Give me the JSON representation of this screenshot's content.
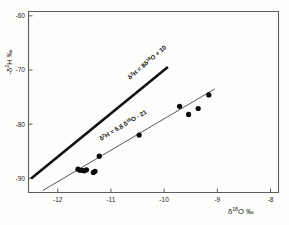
{
  "figure": {
    "kind": "isotope-cross-plot",
    "background_color": "#fdfdfc"
  },
  "axes": {
    "x_title_main": "O",
    "x_title_delta": "δ",
    "x_title_sup": "18",
    "x_title_permil": "‰",
    "y_title_delta": "-δ",
    "y_title_sup": "2",
    "y_title_main": "H",
    "y_title_permil": "‰",
    "x_ticks": [
      "-12",
      "-11",
      "-10",
      "-9",
      "-8"
    ],
    "y_ticks": [
      "-60",
      "-70",
      "-80",
      "-90"
    ],
    "x_tick_values": [
      -12,
      -11,
      -10,
      -9,
      -8
    ],
    "y_tick_values": [
      -60,
      -70,
      -80,
      -90
    ]
  },
  "annotations": {
    "gmwl": {
      "prefix": "δ",
      "sup1": "2",
      "mid": "H = 8δ",
      "sup2": "18",
      "suffix": "O + 10",
      "full_text": "δ²H = 8δ¹⁸O + 10",
      "rotation": -41,
      "x": 130,
      "y": 80
    },
    "lmwl": {
      "prefix": "δ",
      "sup1": "2",
      "mid": "H = 5.8 δ",
      "sup2": "18",
      "suffix": "O - 21",
      "full_text": "δ²H = 5.8 δ¹⁸O - 21",
      "rotation": -31,
      "x": 101,
      "y": 141
    }
  },
  "chart_data": {
    "type": "scatter",
    "title": "",
    "subtitle": "",
    "xlabel": "δ¹⁸O ‰",
    "ylabel": "-δ²H ‰",
    "xlim": [
      -12.55,
      -7.85
    ],
    "ylim": [
      -92.6,
      -59.2
    ],
    "grid": false,
    "legend": "none",
    "x": [
      -11.62,
      -11.58,
      -11.55,
      -11.5,
      -11.46,
      -11.33,
      -11.3,
      -11.22,
      -10.47,
      -9.71,
      -9.54,
      -9.36,
      -9.16
    ],
    "y": [
      -88.3,
      -88.5,
      -88.5,
      -88.6,
      -88.4,
      -88.9,
      -88.7,
      -85.9,
      -82.0,
      -76.7,
      -78.2,
      -77.1,
      -74.6
    ],
    "points": [
      {
        "x": -11.62,
        "y": -88.3
      },
      {
        "x": -11.58,
        "y": -88.5
      },
      {
        "x": -11.55,
        "y": -88.5
      },
      {
        "x": -11.5,
        "y": -88.6
      },
      {
        "x": -11.46,
        "y": -88.4
      },
      {
        "x": -11.33,
        "y": -88.9
      },
      {
        "x": -11.3,
        "y": -88.7
      },
      {
        "x": -11.22,
        "y": -85.9
      },
      {
        "x": -10.47,
        "y": -82.0
      },
      {
        "x": -9.71,
        "y": -76.7
      },
      {
        "x": -9.54,
        "y": -78.2
      },
      {
        "x": -9.36,
        "y": -77.1
      },
      {
        "x": -9.16,
        "y": -74.6
      }
    ],
    "point_marker": "filled-circle",
    "point_color": "#0b0b0b",
    "point_radius_px": 2.6,
    "series": [
      {
        "name": "Global Meteoric Water Line",
        "type": "line",
        "equation": "δ²H = 8δ¹⁸O + 10",
        "slope": 8,
        "intercept": 10,
        "color": "#111111",
        "width_px": 2.6,
        "x_from": -12.5,
        "x_to": -9.93
      },
      {
        "name": "Local Meteoric Water Line",
        "type": "line",
        "equation": "δ²H = 5.8 δ¹⁸O - 21",
        "slope": 5.8,
        "intercept": -21,
        "color": "#3a3a3a",
        "width_px": 0.85,
        "x_from": -12.28,
        "x_to": -9.05
      }
    ]
  }
}
